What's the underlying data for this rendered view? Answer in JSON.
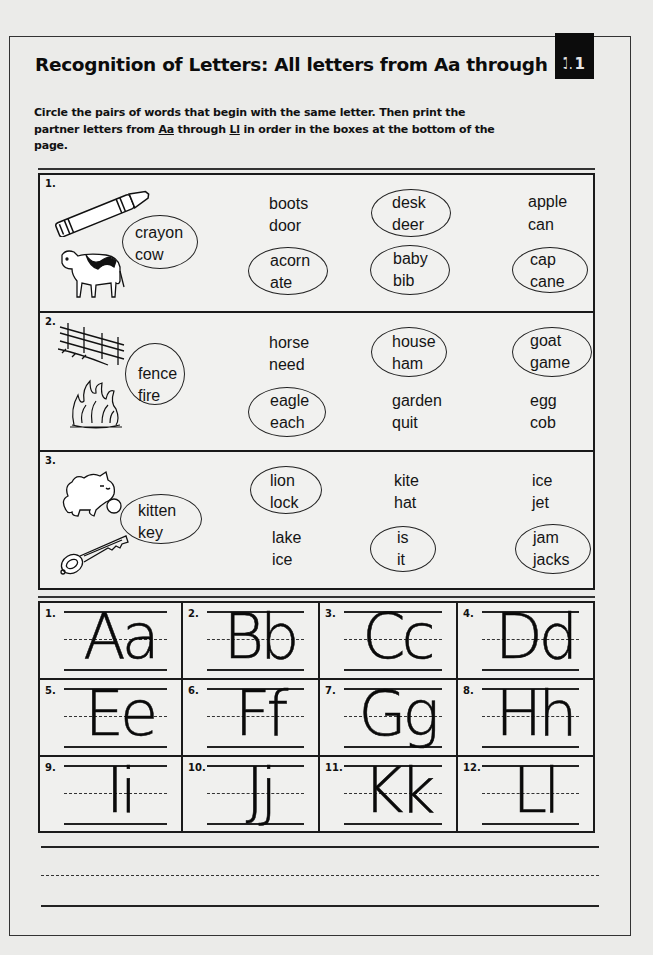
{
  "header": {
    "title": "Recognition of Letters: All letters from Aa through Ll",
    "page_number": "11"
  },
  "instructions": {
    "part1": "Circle the pairs of words that begin with the same letter. Then print the partner letters from ",
    "u1": "Aa",
    "part2": " through ",
    "u2": "Ll",
    "part3": " in order in the boxes at the bottom of the page."
  },
  "exercises": [
    {
      "number": "1.",
      "pictures": [
        "crayon-icon",
        "cow-icon"
      ],
      "picture_pair": {
        "w1": "crayon",
        "w2": "cow",
        "circled": true
      },
      "pairs": [
        {
          "w1": "boots",
          "w2": "door",
          "circled": false
        },
        {
          "w1": "desk",
          "w2": "deer",
          "circled": true
        },
        {
          "w1": "apple",
          "w2": "can",
          "circled": false
        },
        {
          "w1": "acorn",
          "w2": "ate",
          "circled": true
        },
        {
          "w1": "baby",
          "w2": "bib",
          "circled": true
        },
        {
          "w1": "cap",
          "w2": "cane",
          "circled": true
        }
      ]
    },
    {
      "number": "2.",
      "pictures": [
        "fence-icon",
        "fire-icon"
      ],
      "picture_pair": {
        "w1": "fence",
        "w2": "fire",
        "circled": true
      },
      "pairs": [
        {
          "w1": "horse",
          "w2": "need",
          "circled": false
        },
        {
          "w1": "house",
          "w2": "ham",
          "circled": true
        },
        {
          "w1": "goat",
          "w2": "game",
          "circled": true
        },
        {
          "w1": "eagle",
          "w2": "each",
          "circled": true
        },
        {
          "w1": "garden",
          "w2": "quit",
          "circled": false
        },
        {
          "w1": "egg",
          "w2": "cob",
          "circled": false
        }
      ]
    },
    {
      "number": "3.",
      "pictures": [
        "kitten-icon",
        "key-icon"
      ],
      "picture_pair": {
        "w1": "kitten",
        "w2": "key",
        "circled": true
      },
      "pairs": [
        {
          "w1": "lion",
          "w2": "lock",
          "circled": true
        },
        {
          "w1": "kite",
          "w2": "hat",
          "circled": false
        },
        {
          "w1": "ice",
          "w2": "jet",
          "circled": false
        },
        {
          "w1": "lake",
          "w2": "ice",
          "circled": false
        },
        {
          "w1": "is",
          "w2": "it",
          "circled": true
        },
        {
          "w1": "jam",
          "w2": "jacks",
          "circled": true
        }
      ]
    }
  ],
  "letter_boxes": [
    {
      "number": "1.",
      "letters": "Aa"
    },
    {
      "number": "2.",
      "letters": "Bb"
    },
    {
      "number": "3.",
      "letters": "Cc"
    },
    {
      "number": "4.",
      "letters": "Dd"
    },
    {
      "number": "5.",
      "letters": "Ee"
    },
    {
      "number": "6.",
      "letters": "Ff"
    },
    {
      "number": "7.",
      "letters": "Gg"
    },
    {
      "number": "8.",
      "letters": "Hh"
    },
    {
      "number": "9.",
      "letters": "Ii"
    },
    {
      "number": "10.",
      "letters": "Jj"
    },
    {
      "number": "11.",
      "letters": "Kk"
    },
    {
      "number": "12.",
      "letters": "Ll"
    }
  ]
}
